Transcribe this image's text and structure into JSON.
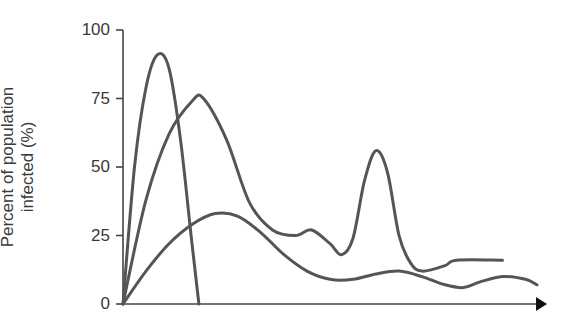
{
  "chart_data": {
    "type": "line",
    "title": "",
    "xlabel": "",
    "ylabel": "Percent of population infected (%)",
    "ylabel_lines": [
      "Percent of population",
      "infected (%)"
    ],
    "yticks": [
      "0",
      "25",
      "50",
      "75",
      "100"
    ],
    "ylim": [
      0,
      100
    ],
    "x_axis_arrow": true,
    "grid": false,
    "legend": null,
    "line_color": "#555555",
    "series": [
      {
        "name": "curve-a",
        "points": [
          [
            0,
            0
          ],
          [
            5,
            50
          ],
          [
            10,
            79
          ],
          [
            15,
            91
          ],
          [
            20,
            86
          ],
          [
            25,
            60
          ],
          [
            30,
            22
          ],
          [
            33,
            0
          ]
        ]
      },
      {
        "name": "curve-b",
        "points": [
          [
            0,
            0
          ],
          [
            10,
            38
          ],
          [
            20,
            62
          ],
          [
            30,
            74
          ],
          [
            35,
            75
          ],
          [
            45,
            60
          ],
          [
            55,
            37
          ],
          [
            65,
            27
          ],
          [
            75,
            25
          ],
          [
            82,
            27
          ],
          [
            90,
            22
          ],
          [
            95,
            18
          ],
          [
            100,
            24
          ],
          [
            105,
            45
          ],
          [
            110,
            56
          ],
          [
            115,
            48
          ],
          [
            120,
            25
          ],
          [
            125,
            15
          ],
          [
            130,
            12
          ],
          [
            140,
            14
          ],
          [
            145,
            16
          ],
          [
            165,
            16
          ]
        ]
      },
      {
        "name": "curve-c",
        "points": [
          [
            0,
            0
          ],
          [
            10,
            12
          ],
          [
            20,
            22
          ],
          [
            30,
            29
          ],
          [
            40,
            33
          ],
          [
            50,
            32
          ],
          [
            60,
            26
          ],
          [
            70,
            18
          ],
          [
            80,
            12
          ],
          [
            90,
            9
          ],
          [
            100,
            9
          ],
          [
            110,
            11
          ],
          [
            120,
            12
          ],
          [
            130,
            10
          ],
          [
            140,
            7
          ],
          [
            148,
            6
          ],
          [
            155,
            8
          ],
          [
            165,
            10
          ],
          [
            175,
            9
          ],
          [
            180,
            7
          ]
        ]
      }
    ]
  }
}
